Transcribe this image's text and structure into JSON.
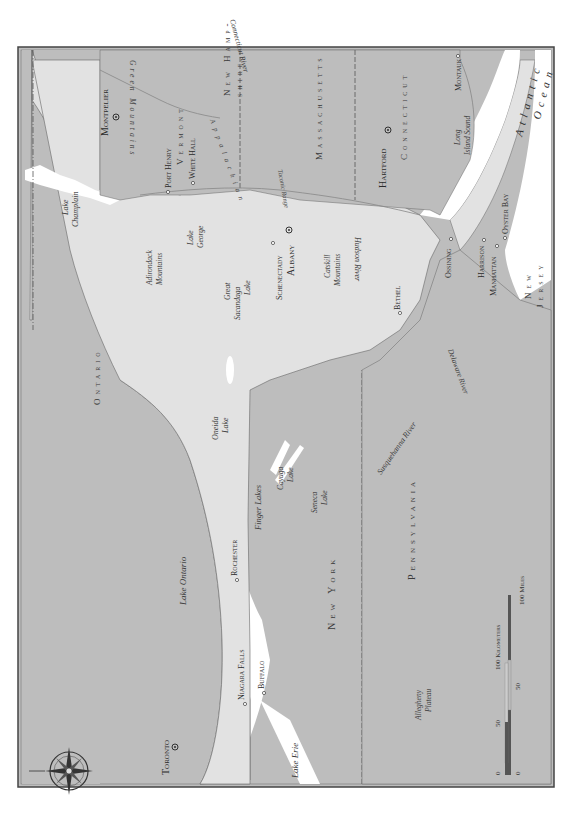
{
  "map": {
    "orientation": "rotated-90-ccw",
    "colors": {
      "ny_land": "#e2e2e2",
      "other_land": "#bdbdbd",
      "water": "#ffffff",
      "border": "#555555",
      "frame": "#444444"
    },
    "regions": {
      "ontario": "Ontario",
      "new_york": "New York",
      "pennsylvania": "Pennsylvania",
      "vermont": "Vermont",
      "new_hampshire_1": "New Hamp-",
      "new_hampshire_2": "shire",
      "massachusetts": "Massachusetts",
      "connecticut": "Connecticut",
      "new_jersey_1": "New",
      "new_jersey_2": "Jersey"
    },
    "cities": {
      "toronto": "Toronto",
      "niagara_falls": "Niagara Falls",
      "buffalo": "Buffalo",
      "rochester": "Rochester",
      "schenectady": "Schenectady",
      "albany": "Albany",
      "bethel": "Bethel",
      "ossining": "Ossining",
      "harrison": "Harrison",
      "manhattan": "Manhattan",
      "oyster_bay": "Oyster Bay",
      "montauk": "Montauk",
      "hartford": "Hartford",
      "montpelier": "Montpelier",
      "port_henry": "Port Henry",
      "white_hall": "White Hall"
    },
    "water": {
      "lake_ontario": "Lake Ontario",
      "lake_erie": "Lake Erie",
      "lake_champlain_1": "Lake",
      "lake_champlain_2": "Champlain",
      "lake_george_1": "Lake",
      "lake_george_2": "George",
      "great_sacandaga_1": "Great",
      "great_sacandaga_2": "Sacandaga",
      "great_sacandaga_3": "Lake",
      "oneida_1": "Oneida",
      "oneida_2": "Lake",
      "cayuga_1": "Cayuga",
      "cayuga_2": "Lake",
      "seneca_1": "Seneca",
      "seneca_2": "Lake",
      "finger_lakes": "Finger Lakes",
      "hudson_river": "Hudson River",
      "connecticut_river": "Connecticut River",
      "delaware_river": "Delaware River",
      "susquehanna_river": "Susquehanna River",
      "long_island_sound_1": "Long",
      "long_island_sound_2": "Island Sound",
      "atlantic_1": "Atlantic",
      "atlantic_2": "Ocean"
    },
    "features": {
      "adirondack_1": "Adirondack",
      "adirondack_2": "Mountains",
      "catskill_1": "Catskill",
      "catskill_2": "Mountains",
      "allegheny_1": "Allegheny",
      "allegheny_2": "Plateau",
      "green_mountains": "Green Mountains",
      "taconic_range": "Taconic Range",
      "berkshire": "Appalachian"
    },
    "scale": {
      "km_label": "100 Kilometers",
      "miles_label": "100 Miles",
      "km_ticks": [
        "0",
        "50"
      ],
      "mile_ticks": [
        "0",
        "50"
      ]
    }
  }
}
